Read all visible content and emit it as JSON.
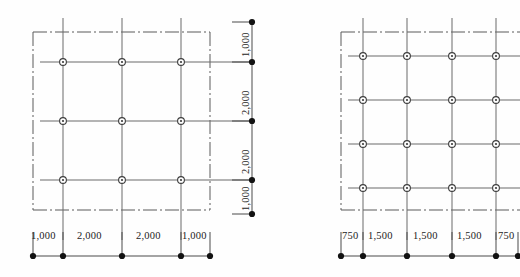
{
  "drawing": {
    "type": "structural-column-grid-plan",
    "figures": [
      {
        "id": "left-plan",
        "name": "column-grid-plan-left",
        "grid_columns": 3,
        "grid_rows": 3,
        "column_marker": "circle-crosshair",
        "boundary_line_style": "dash-dot",
        "horizontal_dimensions": [
          "1,000",
          "2,000",
          "2,000",
          "1,000"
        ],
        "vertical_dimensions": [
          "1,000",
          "2,000",
          "2,000",
          "1,000"
        ],
        "horizontal_total": "6,000",
        "vertical_total": "6,000",
        "dimension_terminator": "filled-dot",
        "bay_dot_count_horizontal": 5,
        "bay_dot_count_vertical": 5
      },
      {
        "id": "right-plan",
        "name": "column-grid-plan-right",
        "grid_columns": 4,
        "grid_rows": 4,
        "column_marker": "circle-crosshair",
        "boundary_line_style": "dash-dot",
        "horizontal_dimensions": [
          "750",
          "1,500",
          "1,500",
          "1,500",
          "750"
        ],
        "vertical_dimensions": [],
        "horizontal_total": "6,000",
        "dimension_terminator": "filled-dot",
        "bay_dot_count_horizontal": 6,
        "cropped_at_right_edge": true
      }
    ],
    "colors": {
      "line": "#4a4a4a",
      "grid_line": "#6b6b6b",
      "boundary": "#5a5a5a",
      "marker_fill": "#ffffff",
      "marker_stroke": "#3c3c3c",
      "dot": "#121212",
      "text": "#1c1c1c",
      "background": "#fefefe"
    }
  }
}
